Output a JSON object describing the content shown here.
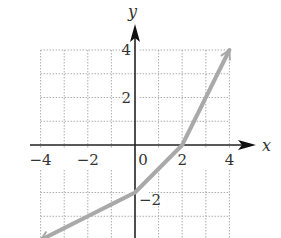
{
  "chart_data": {
    "type": "line",
    "title": "",
    "xlabel": "x",
    "ylabel": "y",
    "xlim": [
      -4,
      4
    ],
    "ylim": [
      -4,
      4
    ],
    "grid": true,
    "grid_style": "dotted",
    "grid_step": 1,
    "x_ticks": [
      -4,
      -2,
      0,
      2,
      4
    ],
    "x_tick_labels": [
      "−4",
      "−2",
      "0",
      "2",
      "4"
    ],
    "y_ticks": [
      4,
      2,
      -2
    ],
    "y_tick_labels": [
      "4",
      "2",
      "−2"
    ],
    "series": [
      {
        "name": "f(x)",
        "color": "#a9a9a9",
        "arrows": "both",
        "x": [
          -4,
          -3,
          -2,
          -1,
          0,
          1,
          2,
          3,
          4
        ],
        "y": [
          -4,
          -3.5,
          -3,
          -2.5,
          -2,
          -1,
          0,
          2,
          4
        ]
      }
    ]
  },
  "colors": {
    "axis": "#222222",
    "grid": "#999999",
    "curve": "#a9a9a9",
    "text": "#333333"
  }
}
